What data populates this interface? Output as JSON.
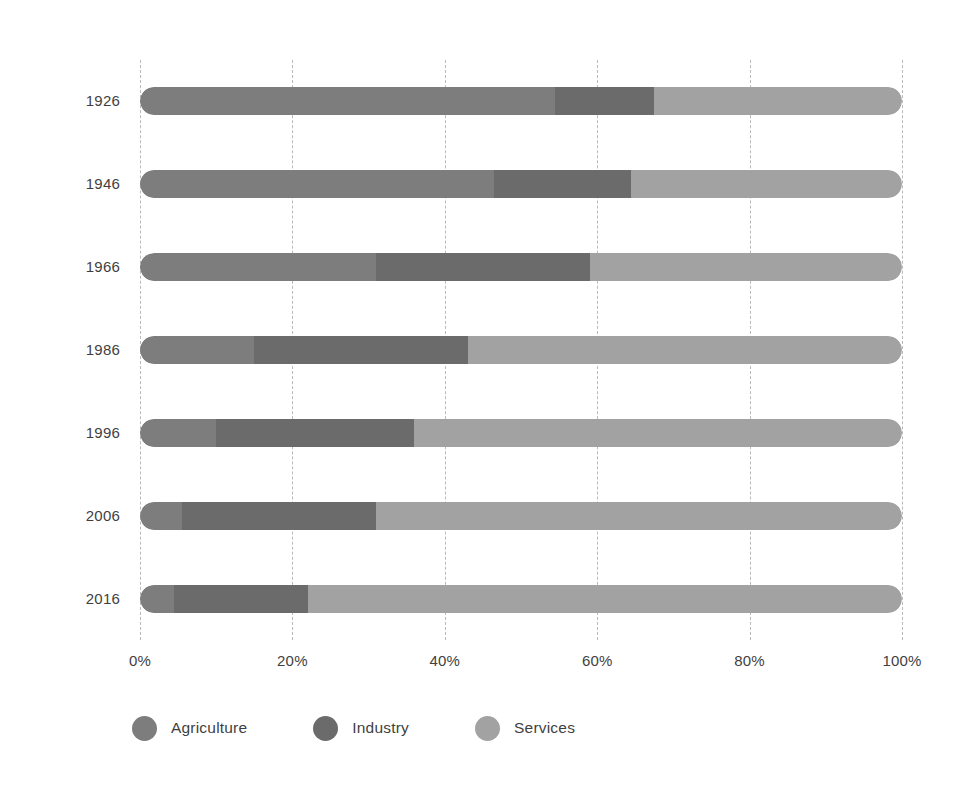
{
  "chart_data": {
    "type": "bar",
    "orientation": "horizontal",
    "stacked": true,
    "normalized": true,
    "title": "",
    "subtitle": "",
    "xlabel": "",
    "ylabel": "",
    "xlim": [
      0,
      100
    ],
    "grid": true,
    "legend_position": "bottom-left",
    "xticks": [
      0,
      20,
      40,
      60,
      80,
      100
    ],
    "xticklabels": [
      "0%",
      "20%",
      "40%",
      "60%",
      "80%",
      "100%"
    ],
    "categories": [
      "1926",
      "1946",
      "1966",
      "1986",
      "1996",
      "2006",
      "2016"
    ],
    "series": [
      {
        "name": "Agriculture",
        "color": "#7d7d7d",
        "values": [
          54.5,
          46.5,
          31.0,
          15.0,
          10.0,
          5.5,
          4.5
        ]
      },
      {
        "name": "Industry",
        "color": "#6b6b6b",
        "values": [
          13.0,
          18.0,
          28.0,
          28.0,
          26.0,
          25.5,
          17.5
        ]
      },
      {
        "name": "Services",
        "color": "#a2a2a2",
        "values": [
          32.5,
          35.5,
          41.0,
          57.0,
          64.0,
          69.0,
          78.0
        ]
      }
    ]
  },
  "axis": {
    "tick_labels": [
      "0%",
      "20%",
      "40%",
      "60%",
      "80%",
      "100%"
    ],
    "year_labels": [
      "1926",
      "1946",
      "1966",
      "1986",
      "1996",
      "2006",
      "2016"
    ]
  },
  "legend": {
    "items": [
      {
        "label": "Agriculture",
        "color": "#7d7d7d",
        "icon": "circle-swatch-icon"
      },
      {
        "label": "Industry",
        "color": "#6b6b6b",
        "icon": "circle-swatch-icon"
      },
      {
        "label": "Services",
        "color": "#a2a2a2",
        "icon": "circle-swatch-icon"
      }
    ]
  },
  "colors": {
    "agriculture": "#7d7d7d",
    "industry": "#6b6b6b",
    "services": "#a2a2a2",
    "gridline": "#b9b9b9",
    "text": "#3f3f3f",
    "background": "#ffffff"
  }
}
